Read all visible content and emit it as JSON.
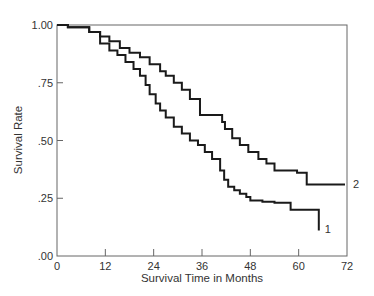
{
  "chart_data": {
    "type": "line",
    "subtype": "kaplan-meier step survival curves",
    "title": "",
    "xlabel": "Survival Time in Months",
    "ylabel": "Survival Rate",
    "xlim": [
      0,
      72
    ],
    "ylim": [
      0,
      1
    ],
    "xticks": [
      0,
      12,
      24,
      36,
      48,
      60,
      72
    ],
    "xtick_labels": [
      "0",
      "12",
      "24",
      "36",
      "48",
      "60",
      "72"
    ],
    "yticks": [
      0,
      0.25,
      0.5,
      0.75,
      1.0
    ],
    "ytick_labels": [
      ".00",
      ".25",
      ".50",
      ".75",
      "1.00"
    ],
    "grid": false,
    "legend": "none (curves labeled directly at right end)",
    "series": [
      {
        "name": "1",
        "label": "1",
        "x": [
          0,
          2.7,
          8,
          10.7,
          13,
          15,
          17,
          19,
          20.6,
          22,
          23,
          24.5,
          25.6,
          27,
          29,
          31,
          33,
          35,
          36.7,
          38.5,
          40.5,
          41.5,
          42.5,
          44,
          45.4,
          47,
          48,
          51,
          54,
          58,
          65,
          65
        ],
        "y": [
          1.0,
          0.99,
          0.97,
          0.92,
          0.89,
          0.87,
          0.84,
          0.81,
          0.78,
          0.74,
          0.7,
          0.66,
          0.63,
          0.6,
          0.56,
          0.53,
          0.5,
          0.48,
          0.45,
          0.42,
          0.37,
          0.33,
          0.3,
          0.285,
          0.27,
          0.255,
          0.24,
          0.235,
          0.23,
          0.2,
          0.2,
          0.11
        ]
      },
      {
        "name": "2",
        "label": "2",
        "x": [
          0,
          2.7,
          8,
          10.7,
          13,
          15.6,
          18,
          20.6,
          23,
          25.6,
          27,
          29,
          31,
          33,
          35.5,
          40,
          41,
          41.7,
          43.5,
          45.4,
          47.5,
          50,
          52,
          54,
          59.6,
          62,
          71.5
        ],
        "y": [
          1.0,
          0.99,
          0.97,
          0.95,
          0.93,
          0.9,
          0.88,
          0.86,
          0.83,
          0.8,
          0.78,
          0.75,
          0.72,
          0.68,
          0.61,
          0.61,
          0.58,
          0.55,
          0.51,
          0.48,
          0.45,
          0.42,
          0.4,
          0.37,
          0.36,
          0.31,
          0.31
        ]
      }
    ],
    "annotations": [
      {
        "text": "1",
        "at": "end of curve 1 (x≈65, y≈0.11)"
      },
      {
        "text": "2",
        "at": "right of plot, end of curve 2 (y≈0.31)"
      }
    ]
  },
  "labels": {
    "xlabel": "Survival Time in Months",
    "ylabel": "Survival Rate",
    "series1": "1",
    "series2": "2",
    "xticks": [
      "0",
      "12",
      "24",
      "36",
      "48",
      "60",
      "72"
    ],
    "yticks": [
      ".00",
      ".25",
      ".50",
      ".75",
      "1.00"
    ]
  }
}
